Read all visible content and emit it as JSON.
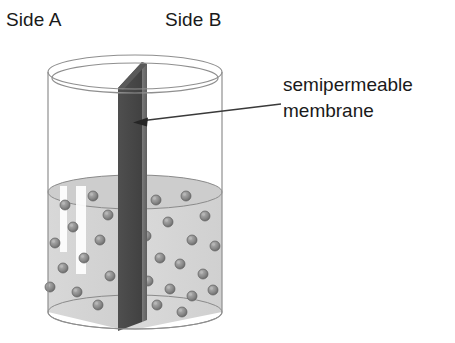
{
  "figure": {
    "title_alt": "Semipermeable membrane dividing a cylindrical container into Side A and Side B",
    "background_color": "#ffffff"
  },
  "labels": {
    "side_a": "Side A",
    "side_b": "Side B"
  },
  "annotation": {
    "line1": "semipermeable",
    "line2": "membrane",
    "leader_line_color": "#3a3a3a",
    "arrow_head_color": "#262626"
  },
  "colors": {
    "glass_outline": "#8f8f8f",
    "glass_body": "#ffffff",
    "liquid_fill": "#d2d2d2",
    "liquid_fill_light": "#dcdcdc",
    "liquid_surface": "#c9c9c9",
    "liquid_outline": "#8a8a8a",
    "membrane_dark_face": "#4a4a4a",
    "membrane_light_face": "#6f6f6f",
    "particle_fill": "#8c8c8c",
    "particle_edge": "#5e5e5e",
    "particle_highlight": "#b9b9b9",
    "highlight_streak": "#ffffff",
    "text": "#1a1a1a"
  },
  "vessel": {
    "type": "cylinder",
    "left_x": 48,
    "right_x": 222,
    "top_rim_center_y": 72,
    "bottom_center_y": 312,
    "rim_ellipse_ry": 17,
    "liquid_surface_center_y": 192,
    "liquid_surface_ry": 17,
    "rim_thickness": 6
  },
  "membrane": {
    "top_left_x": 118,
    "top_right_x": 142,
    "top_apex_y": 62,
    "top_left_y": 88,
    "bottom_left_x": 118,
    "bottom_right_x": 140,
    "bottom_y": 330,
    "description": "vertical divider panel seen in perspective, dark left face and angled top"
  },
  "particles": {
    "count_side_a": 12,
    "count_side_b": 17,
    "radius": 5,
    "side_a": [
      {
        "x": 65,
        "y": 205
      },
      {
        "x": 93,
        "y": 196
      },
      {
        "x": 73,
        "y": 227
      },
      {
        "x": 55,
        "y": 243
      },
      {
        "x": 100,
        "y": 240
      },
      {
        "x": 84,
        "y": 258
      },
      {
        "x": 63,
        "y": 268
      },
      {
        "x": 108,
        "y": 215
      },
      {
        "x": 50,
        "y": 287
      },
      {
        "x": 77,
        "y": 292
      },
      {
        "x": 98,
        "y": 305
      },
      {
        "x": 110,
        "y": 276
      }
    ],
    "side_b": [
      {
        "x": 156,
        "y": 200
      },
      {
        "x": 186,
        "y": 196
      },
      {
        "x": 205,
        "y": 216
      },
      {
        "x": 168,
        "y": 222
      },
      {
        "x": 146,
        "y": 236
      },
      {
        "x": 192,
        "y": 240
      },
      {
        "x": 215,
        "y": 246
      },
      {
        "x": 160,
        "y": 258
      },
      {
        "x": 180,
        "y": 264
      },
      {
        "x": 203,
        "y": 274
      },
      {
        "x": 148,
        "y": 281
      },
      {
        "x": 170,
        "y": 289
      },
      {
        "x": 192,
        "y": 296
      },
      {
        "x": 213,
        "y": 290
      },
      {
        "x": 157,
        "y": 305
      },
      {
        "x": 182,
        "y": 312
      },
      {
        "x": 134,
        "y": 255
      }
    ]
  },
  "highlight_streaks": [
    {
      "x": 60,
      "y": 186,
      "w": 7,
      "h": 66
    },
    {
      "x": 76,
      "y": 186,
      "w": 10,
      "h": 88
    }
  ],
  "leader": {
    "start_x": 281,
    "start_y": 104,
    "end_x": 136,
    "end_y": 122
  }
}
